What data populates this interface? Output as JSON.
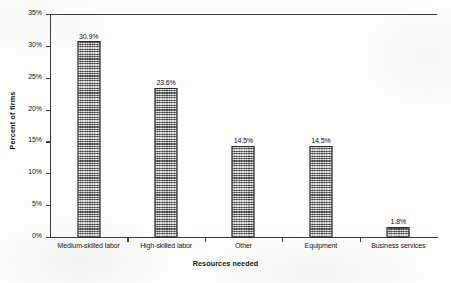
{
  "chart_data": {
    "type": "bar",
    "title": "",
    "xlabel": "Resources needed",
    "ylabel": "Percent of firms",
    "categories": [
      "Medium-skilled labor",
      "High-skilled labor",
      "Other",
      "Equipment",
      "Business services"
    ],
    "values": [
      30.9,
      23.6,
      14.5,
      14.5,
      1.8
    ],
    "value_labels": [
      "30.9%",
      "23.6%",
      "14.5%",
      "14.5%",
      "1.8%"
    ],
    "ylim": [
      0,
      35
    ],
    "ytick_values": [
      0,
      5,
      10,
      15,
      20,
      25,
      30,
      35
    ],
    "ytick_labels": [
      "0%",
      "5%",
      "10%",
      "15%",
      "20%",
      "25%",
      "30%",
      "35%"
    ],
    "grid": false,
    "legend": null,
    "series": [
      {
        "name": "Percent of firms",
        "values": [
          30.9,
          23.6,
          14.5,
          14.5,
          1.8
        ],
        "color": "#9a9a9a"
      }
    ]
  },
  "style": {
    "bar_fill": "#9a9a9a",
    "bar_border": "#2b2b2b",
    "axis_color": "#3a3a3a",
    "text_color": "#111111",
    "background": "#fdfdfb"
  }
}
